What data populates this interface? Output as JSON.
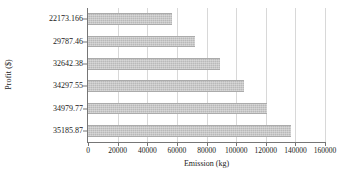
{
  "chart_data": {
    "type": "bar",
    "orientation": "horizontal",
    "title": "",
    "xlabel": "Emission (kg)",
    "ylabel": "Profit ($)",
    "categories": [
      "22173.166",
      "29787.46",
      "32642.38",
      "34297.55",
      "34979.77",
      "35185.87"
    ],
    "values": [
      56700,
      72300,
      89100,
      105400,
      120800,
      137100
    ],
    "xlim": [
      0,
      160000
    ],
    "xticks": [
      0,
      20000,
      40000,
      60000,
      80000,
      100000,
      120000,
      140000,
      160000
    ],
    "xtick_labels": [
      "0",
      "20000",
      "40000",
      "60000",
      "80000",
      "100000",
      "120000",
      "140000",
      "160000"
    ],
    "grid": true,
    "grid_axis": "x",
    "legend": false,
    "bar_color": "#b9b9b9",
    "axis_color": "#767676",
    "grid_color": "#d8d8d8"
  }
}
